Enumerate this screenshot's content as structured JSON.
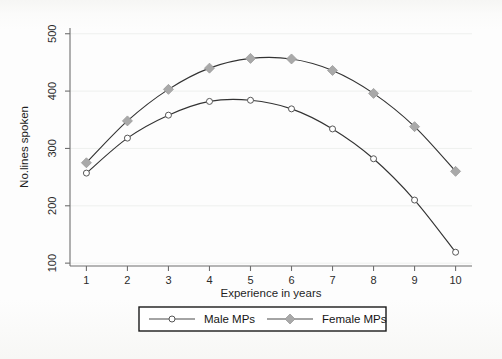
{
  "chart_data": {
    "type": "line",
    "title": "",
    "xlabel": "Experience in years",
    "ylabel": "No.lines spoken",
    "x": [
      1,
      2,
      3,
      4,
      5,
      6,
      7,
      8,
      9,
      10
    ],
    "xticklabels": [
      "1",
      "2",
      "3",
      "4",
      "5",
      "6",
      "7",
      "8",
      "9",
      "10"
    ],
    "yticks": [
      100,
      200,
      300,
      400,
      500
    ],
    "yticklabels": [
      "100",
      "200",
      "300",
      "400",
      "500"
    ],
    "xlim": [
      0.6,
      10.4
    ],
    "ylim": [
      95,
      510
    ],
    "grid": "horizontal-faint",
    "legend_position": "below-axis-center",
    "series": [
      {
        "name": "Male MPs",
        "marker": "open-circle",
        "color": "#555555",
        "values": [
          257,
          318,
          358,
          382,
          384,
          369,
          334,
          282,
          210,
          119
        ]
      },
      {
        "name": "Female MPs",
        "marker": "filled-diamond",
        "color": "#a9a9a9",
        "values": [
          275,
          348,
          403,
          440,
          457,
          456,
          436,
          396,
          338,
          260
        ]
      }
    ]
  },
  "legend": {
    "entries": [
      {
        "label": "Male MPs"
      },
      {
        "label": "Female MPs"
      }
    ]
  },
  "colors": {
    "axis": "#6f6f6f",
    "grid": "#eef0ee",
    "male_marker": "#ffffff",
    "female_marker": "#a9a9a9",
    "line": "#333333"
  }
}
